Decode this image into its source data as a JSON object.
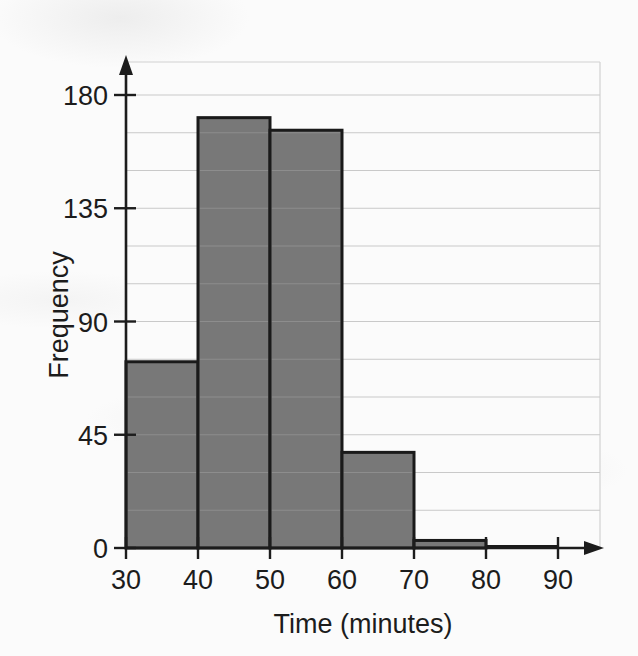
{
  "chart_data": {
    "type": "bar",
    "title": "",
    "subtitle": "",
    "xlabel": "Time (minutes)",
    "ylabel": "Frequency",
    "categories": [
      "30-40",
      "40-50",
      "50-60",
      "60-70",
      "70-80",
      "80-90"
    ],
    "bin_edges": [
      30,
      40,
      50,
      60,
      70,
      80,
      90
    ],
    "values": [
      74,
      171,
      166,
      38,
      3,
      0
    ],
    "xlim": [
      30,
      90
    ],
    "ylim": [
      0,
      195
    ],
    "x_ticks": [
      "30",
      "40",
      "50",
      "60",
      "70",
      "80",
      "90"
    ],
    "x_tick_values": [
      30,
      40,
      50,
      60,
      70,
      80,
      90
    ],
    "y_ticks": [
      "0",
      "45",
      "90",
      "135",
      "180"
    ],
    "y_tick_values": [
      0,
      45,
      90,
      135,
      180
    ],
    "y_minor_step": 15,
    "grid": "horizontal",
    "legend": "none",
    "bar_fill_color": "#787878",
    "bar_edge_color": "#1a1a1a",
    "grid_color": "#c9c9c9",
    "axis_color": "#1c1c1c",
    "background_color": "#fbfbfb"
  },
  "figure": {
    "name": "histogram-time-minutes-frequency",
    "y_axis_arrow": "arrow-up",
    "x_axis_arrow": "arrow-right"
  }
}
